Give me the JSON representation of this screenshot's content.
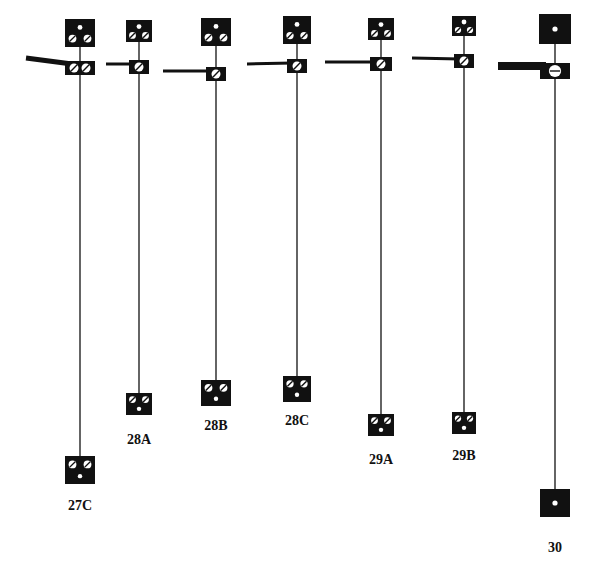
{
  "diagram": {
    "type": "electrode-connection-diagrams",
    "ink_color": "#111111",
    "background": "#ffffff",
    "items": [
      {
        "label": "27C",
        "x": 80,
        "top": {
          "y": 33,
          "w": 30,
          "h": 28,
          "dots": "dot-top-two-slots"
        },
        "mid": {
          "y": 68,
          "w": 30,
          "h": 14,
          "slots": 2
        },
        "lever": {
          "x1": 26,
          "y1": 58,
          "x2": 66,
          "y2": 64,
          "thick": 5
        },
        "bottom": {
          "y": 470,
          "w": 30,
          "h": 28,
          "dots": "two-slots-dot-bottom"
        },
        "label_y": 498
      },
      {
        "label": "28A",
        "x": 139,
        "top": {
          "y": 31,
          "w": 26,
          "h": 22,
          "dots": "dot-top-two-slots"
        },
        "mid": {
          "y": 67,
          "w": 20,
          "h": 14,
          "slots": 1
        },
        "lever": {
          "x1": 106,
          "y1": 64,
          "x2": 129,
          "y2": 64,
          "thick": 3
        },
        "bottom": {
          "y": 404,
          "w": 26,
          "h": 22,
          "dots": "two-slots-dot-bottom"
        },
        "label_y": 432
      },
      {
        "label": "28B",
        "x": 216,
        "top": {
          "y": 32,
          "w": 30,
          "h": 28,
          "dots": "dot-top-two-slots"
        },
        "mid": {
          "y": 74,
          "w": 20,
          "h": 14,
          "slots": 1
        },
        "lever": {
          "x1": 163,
          "y1": 71,
          "x2": 206,
          "y2": 71,
          "thick": 3
        },
        "bottom": {
          "y": 393,
          "w": 30,
          "h": 26,
          "dots": "two-slots-dot-bottom"
        },
        "label_y": 418
      },
      {
        "label": "28C",
        "x": 297,
        "top": {
          "y": 30,
          "w": 28,
          "h": 28,
          "dots": "dot-top-two-slots"
        },
        "mid": {
          "y": 66,
          "w": 20,
          "h": 14,
          "slots": 1
        },
        "lever": {
          "x1": 247,
          "y1": 64,
          "x2": 287,
          "y2": 63,
          "thick": 3
        },
        "bottom": {
          "y": 389,
          "w": 28,
          "h": 26,
          "dots": "two-slots-dot-bottom"
        },
        "label_y": 413
      },
      {
        "label": "29A",
        "x": 381,
        "top": {
          "y": 29,
          "w": 26,
          "h": 22,
          "dots": "dot-top-two-slots"
        },
        "mid": {
          "y": 64,
          "w": 22,
          "h": 14,
          "slots": 1
        },
        "lever": {
          "x1": 325,
          "y1": 62,
          "x2": 370,
          "y2": 62,
          "thick": 3
        },
        "bottom": {
          "y": 425,
          "w": 26,
          "h": 22,
          "dots": "two-slots-dot-bottom"
        },
        "label_y": 452
      },
      {
        "label": "29B",
        "x": 464,
        "top": {
          "y": 26,
          "w": 24,
          "h": 20,
          "dots": "dot-top-two-slots"
        },
        "mid": {
          "y": 61,
          "w": 20,
          "h": 14,
          "slots": 1
        },
        "lever": {
          "x1": 412,
          "y1": 58,
          "x2": 454,
          "y2": 59,
          "thick": 3
        },
        "bottom": {
          "y": 423,
          "w": 24,
          "h": 22,
          "dots": "two-slots-dot-bottom"
        },
        "label_y": 448
      },
      {
        "label": "30",
        "x": 555,
        "top": {
          "y": 29,
          "w": 32,
          "h": 30,
          "dots": "single-dot"
        },
        "mid": {
          "y": 71,
          "w": 30,
          "h": 16,
          "slots": 1
        },
        "lever": {
          "x1": 498,
          "y1": 66,
          "x2": 540,
          "y2": 66,
          "thick": 8
        },
        "bottom": {
          "y": 503,
          "w": 30,
          "h": 28,
          "dots": "single-dot"
        },
        "label_y": 540
      }
    ]
  }
}
